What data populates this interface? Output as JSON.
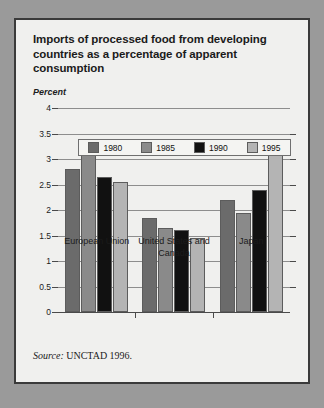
{
  "card": {
    "title": "Imports of processed food from developing countries as a percentage of apparent consumption",
    "axis_unit": "Percent",
    "source_word": "Source:",
    "source_text": " UNCTAD 1996."
  },
  "colors": {
    "page_background": "#9a9a9a",
    "card_background": "#f0f0ee",
    "card_border": "#3a3a3a",
    "series_1980": "#6b6b6b",
    "series_1985": "#8a8a8a",
    "series_1990": "#111111",
    "series_1995": "#b4b4b4",
    "gridline": "#8d8d8d",
    "axis": "#4a4a4a"
  },
  "chart_data": {
    "type": "bar",
    "title": "Imports of processed food from developing countries as a percentage of apparent consumption",
    "xlabel": "",
    "ylabel": "Percent",
    "ylim": [
      0,
      4
    ],
    "ytick_labels": [
      "4",
      "3.5",
      "3",
      "2.5",
      "2",
      "1.5",
      "1",
      "0.5",
      "0"
    ],
    "ytick_values": [
      4,
      3.5,
      3,
      2.5,
      2,
      1.5,
      1,
      0.5,
      0
    ],
    "grid": true,
    "legend_position": "top-inside",
    "categories": [
      "European Union",
      "United States and Canada",
      "Japan"
    ],
    "series": [
      {
        "name": "1980",
        "color": "#6b6b6b",
        "values": [
          2.8,
          1.85,
          2.2
        ]
      },
      {
        "name": "1985",
        "color": "#8a8a8a",
        "values": [
          3.15,
          1.65,
          1.95
        ]
      },
      {
        "name": "1990",
        "color": "#111111",
        "values": [
          2.65,
          1.6,
          2.4
        ]
      },
      {
        "name": "1995",
        "color": "#b4b4b4",
        "values": [
          2.55,
          1.45,
          3.35
        ]
      }
    ],
    "source": "Source: UNCTAD 1996."
  }
}
